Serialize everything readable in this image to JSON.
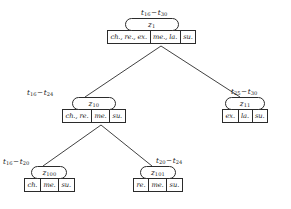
{
  "diagram": {
    "type": "hierarchical-tree",
    "title": "",
    "stroke_color": "#2b2b2b",
    "text_color": "#1a1a1a",
    "background_color": "#ffffff",
    "range_separator": "−"
  },
  "nodes": [
    {
      "id": "z1",
      "label_base": "z",
      "label_sub": "1",
      "range": {
        "from_base": "t",
        "from_sub": "16",
        "to_base": "t",
        "to_sub": "30"
      },
      "cells": [
        "ch., re., ex.",
        "me., la.",
        "su."
      ]
    },
    {
      "id": "z10",
      "label_base": "z",
      "label_sub": "10",
      "range": {
        "from_base": "t",
        "from_sub": "16",
        "to_base": "t",
        "to_sub": "24"
      },
      "cells": [
        "ch., re.",
        "me.",
        "su."
      ]
    },
    {
      "id": "z11",
      "label_base": "z",
      "label_sub": "11",
      "range": {
        "from_base": "t",
        "from_sub": "25",
        "to_base": "t",
        "to_sub": "30"
      },
      "cells": [
        "ex.",
        "la.",
        "su."
      ]
    },
    {
      "id": "z100",
      "label_base": "z",
      "label_sub": "100",
      "range": {
        "from_base": "t",
        "from_sub": "16",
        "to_base": "t",
        "to_sub": "20"
      },
      "cells": [
        "ch.",
        "me.",
        "su."
      ]
    },
    {
      "id": "z101",
      "label_base": "z",
      "label_sub": "101",
      "range": {
        "from_base": "t",
        "from_sub": "20",
        "to_base": "t",
        "to_sub": "24"
      },
      "cells": [
        "re.",
        "me.",
        "su."
      ]
    }
  ],
  "edges": [
    {
      "from": "z1",
      "to": "z10"
    },
    {
      "from": "z1",
      "to": "z11"
    },
    {
      "from": "z10",
      "to": "z100"
    },
    {
      "from": "z10",
      "to": "z101"
    }
  ]
}
